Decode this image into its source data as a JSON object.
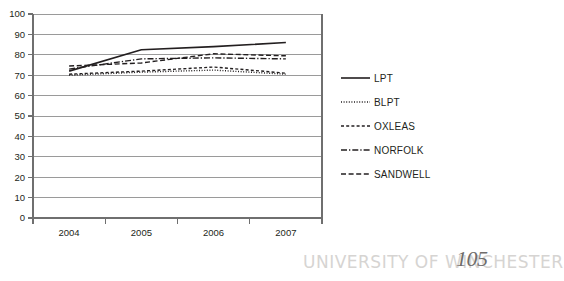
{
  "chart_data": {
    "type": "line",
    "title": "",
    "xlabel": "",
    "ylabel": "",
    "categories": [
      "2004",
      "2005",
      "2006",
      "2007"
    ],
    "ylim": [
      0,
      100
    ],
    "yticks": [
      0,
      10,
      20,
      30,
      40,
      50,
      60,
      70,
      80,
      90,
      100
    ],
    "grid": "horizontal",
    "legend_position": "right",
    "series": [
      {
        "name": "LPT",
        "style": "solid",
        "values": [
          72,
          82.5,
          84,
          86
        ]
      },
      {
        "name": "BLPT",
        "style": "dotted",
        "values": [
          70,
          71.5,
          72.5,
          70.5
        ]
      },
      {
        "name": "OXLEAS",
        "style": "dashed",
        "values": [
          70.5,
          72,
          74,
          71
        ]
      },
      {
        "name": "NORFOLK",
        "style": "dash-dot",
        "values": [
          73,
          78,
          78.5,
          78
        ]
      },
      {
        "name": "SANDWELL",
        "style": "long-dashed",
        "values": [
          74.5,
          76,
          80.5,
          79.5
        ]
      }
    ]
  },
  "axis": {
    "y_tick_labels": [
      "100",
      "90",
      "80",
      "70",
      "60",
      "50",
      "40",
      "30",
      "20",
      "10",
      "0"
    ],
    "x_tick_labels": [
      "2004",
      "2005",
      "2006",
      "2007"
    ]
  },
  "legend": {
    "items": [
      {
        "label": "LPT",
        "style": "solid"
      },
      {
        "label": "BLPT",
        "style": "dotted"
      },
      {
        "label": "OXLEAS",
        "style": "dashed"
      },
      {
        "label": "NORFOLK",
        "style": "dash-dot"
      },
      {
        "label": "SANDWELL",
        "style": "long-dashed"
      }
    ]
  },
  "watermark": {
    "text": "UNIVERSITY OF WINCHESTER",
    "page_number": "105"
  },
  "colors": {
    "line": "#231f20",
    "grid": "#9a9a9a",
    "axis": "#6f6f6f",
    "text": "#231f20",
    "watermark": "#d6d4d2",
    "background": "#ffffff"
  }
}
